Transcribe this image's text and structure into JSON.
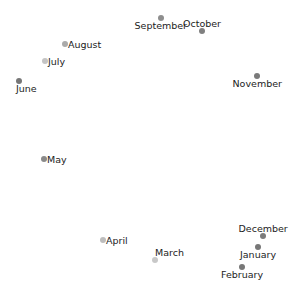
{
  "chart_data": {
    "type": "scatter",
    "title": "",
    "xlabel": "",
    "ylabel": "",
    "grid": false,
    "axes_visible": false,
    "legend": null,
    "points": [
      {
        "label": "June",
        "x": 19,
        "y": 81,
        "color": "#777777",
        "label_pos": "below"
      },
      {
        "label": "July",
        "x": 45,
        "y": 61,
        "color": "#c4c4c4",
        "label_pos": "right"
      },
      {
        "label": "August",
        "x": 65,
        "y": 44,
        "color": "#aaaaaa",
        "label_pos": "right"
      },
      {
        "label": "September",
        "x": 161,
        "y": 18,
        "color": "#8e8e8e",
        "label_pos": "below"
      },
      {
        "label": "October",
        "x": 202,
        "y": 31,
        "color": "#808080",
        "label_pos": "above"
      },
      {
        "label": "November",
        "x": 257,
        "y": 76,
        "color": "#7a7a7a",
        "label_pos": "below"
      },
      {
        "label": "December",
        "x": 263,
        "y": 236,
        "color": "#7c7c7c",
        "label_pos": "above"
      },
      {
        "label": "January",
        "x": 258,
        "y": 247,
        "color": "#777777",
        "label_pos": "below"
      },
      {
        "label": "February",
        "x": 242,
        "y": 267,
        "color": "#777777",
        "label_pos": "below"
      },
      {
        "label": "March",
        "x": 155,
        "y": 260,
        "color": "#c8c8c8",
        "label_pos": "above"
      },
      {
        "label": "April",
        "x": 103,
        "y": 240,
        "color": "#bdbdbd",
        "label_pos": "right"
      },
      {
        "label": "May",
        "x": 44,
        "y": 159,
        "color": "#8a8a8a",
        "label_pos": "right"
      }
    ]
  }
}
